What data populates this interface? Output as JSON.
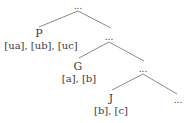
{
  "tree": {
    "root": {
      "label": "..."
    },
    "nodes": [
      {
        "id": "P",
        "label": "P",
        "features": "[ua], [ub], [uc]"
      },
      {
        "id": "n1",
        "label": "..."
      },
      {
        "id": "G",
        "label": "G",
        "features": "[a], [b]"
      },
      {
        "id": "n2",
        "label": "..."
      },
      {
        "id": "J",
        "label": "J",
        "features": "[b], [c]"
      },
      {
        "id": "n3",
        "label": "..."
      }
    ]
  },
  "colors": {
    "line": "#8a8a8a",
    "text": "#3a3a3a"
  }
}
